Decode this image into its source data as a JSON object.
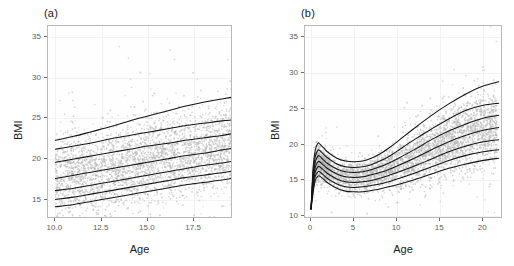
{
  "figure": {
    "panels": [
      {
        "tag": "(a)",
        "xlabel": "Age",
        "ylabel": "BMI",
        "x_ticks": [
          "10.0",
          "12.5",
          "15.0",
          "17.5"
        ],
        "y_ticks": [
          "15",
          "20",
          "25",
          "30",
          "35"
        ]
      },
      {
        "tag": "(b)",
        "xlabel": "Age",
        "ylabel": "BMI",
        "x_ticks": [
          "0",
          "5",
          "10",
          "15",
          "20"
        ],
        "y_ticks": [
          "10",
          "15",
          "20",
          "25",
          "30",
          "35"
        ]
      }
    ],
    "colors": {
      "point": "#b4b4b4",
      "curve": "#141414",
      "panel_border": "#b9b9b9",
      "grid_major": "#f2f2f2",
      "background": "#ffffff",
      "tick_text": "#5c5c5c",
      "axis_title": "#1a1a1a"
    }
  },
  "chart_data": [
    {
      "type": "line",
      "panel": "(a)",
      "title": "(a)",
      "xlabel": "Age",
      "ylabel": "BMI",
      "xlim": [
        9.6,
        19.6
      ],
      "ylim": [
        12.6,
        36.4
      ],
      "x_ticks": [
        10.0,
        12.5,
        15.0,
        17.5
      ],
      "y_ticks": [
        15,
        20,
        25,
        30,
        35
      ],
      "grid": true,
      "legend": "none",
      "description": "Adolescent BMI centile curves (age 10-19.5) over a scatter of individual observations; all seven centiles rise approximately linearly with age.",
      "x": [
        10.0,
        11.0,
        12.0,
        13.0,
        14.0,
        15.0,
        16.0,
        17.0,
        18.0,
        19.0,
        19.5
      ],
      "series": [
        {
          "name": "97th centile",
          "values": [
            22.3,
            22.8,
            23.4,
            24.0,
            24.7,
            25.3,
            25.9,
            26.5,
            27.0,
            27.4,
            27.6
          ]
        },
        {
          "name": "90th centile",
          "values": [
            21.2,
            21.6,
            22.0,
            22.5,
            22.9,
            23.3,
            23.7,
            24.1,
            24.4,
            24.7,
            24.8
          ]
        },
        {
          "name": "75th centile",
          "values": [
            19.6,
            20.0,
            20.4,
            20.8,
            21.2,
            21.6,
            21.9,
            22.3,
            22.6,
            22.9,
            23.1
          ]
        },
        {
          "name": "50th centile",
          "values": [
            17.6,
            18.0,
            18.4,
            18.8,
            19.2,
            19.6,
            20.0,
            20.4,
            20.7,
            21.1,
            21.3
          ]
        },
        {
          "name": "25th centile",
          "values": [
            16.1,
            16.4,
            16.8,
            17.2,
            17.6,
            18.0,
            18.4,
            18.8,
            19.2,
            19.5,
            19.7
          ]
        },
        {
          "name": "10th centile",
          "values": [
            15.0,
            15.3,
            15.7,
            16.1,
            16.5,
            16.9,
            17.3,
            17.7,
            18.0,
            18.3,
            18.5
          ]
        },
        {
          "name": "3rd centile",
          "values": [
            14.1,
            14.4,
            14.8,
            15.2,
            15.6,
            16.0,
            16.4,
            16.8,
            17.1,
            17.4,
            17.6
          ]
        }
      ]
    },
    {
      "type": "line",
      "panel": "(b)",
      "title": "(b)",
      "xlabel": "Age",
      "ylabel": "BMI",
      "xlim": [
        -0.7,
        22.3
      ],
      "ylim": [
        9.6,
        36.6
      ],
      "x_ticks": [
        0,
        5,
        10,
        15,
        20
      ],
      "y_ticks": [
        10,
        15,
        20,
        25,
        30,
        35
      ],
      "grid": true,
      "legend": "none",
      "description": "Full-range BMI centile curves from birth to age 22 over scattered observations; curves rise steeply to an infancy peak near age 0.8, decline to an adiposity rebound near age 6, then rise steadily through adolescence.",
      "x": [
        0.0,
        0.25,
        0.5,
        0.8,
        1.0,
        1.5,
        2.0,
        3.0,
        4.0,
        5.0,
        6.0,
        7.0,
        8.0,
        9.0,
        10.0,
        12.0,
        14.0,
        16.0,
        18.0,
        20.0,
        21.8
      ],
      "series": [
        {
          "name": "97th centile",
          "values": [
            11.0,
            16.9,
            19.3,
            20.2,
            20.1,
            19.5,
            18.9,
            18.1,
            17.7,
            17.6,
            17.7,
            18.1,
            18.7,
            19.5,
            20.4,
            22.3,
            24.1,
            25.7,
            27.1,
            28.2,
            28.8
          ]
        },
        {
          "name": "90th centile",
          "values": [
            11.0,
            16.2,
            18.4,
            19.2,
            19.2,
            18.6,
            18.1,
            17.3,
            16.9,
            16.8,
            16.9,
            17.2,
            17.7,
            18.3,
            19.1,
            20.7,
            22.2,
            23.6,
            24.8,
            25.5,
            25.8
          ]
        },
        {
          "name": "75th centile",
          "values": [
            11.0,
            15.6,
            17.6,
            18.4,
            18.4,
            17.8,
            17.3,
            16.6,
            16.2,
            16.1,
            16.2,
            16.5,
            16.9,
            17.4,
            18.0,
            19.3,
            20.7,
            21.9,
            22.9,
            23.7,
            24.1
          ]
        },
        {
          "name": "50th centile",
          "values": [
            11.0,
            15.0,
            16.9,
            17.6,
            17.6,
            17.1,
            16.6,
            15.9,
            15.5,
            15.4,
            15.5,
            15.8,
            16.1,
            16.5,
            17.0,
            18.1,
            19.3,
            20.4,
            21.3,
            22.0,
            22.4
          ]
        },
        {
          "name": "25th centile",
          "values": [
            11.0,
            14.4,
            16.2,
            16.9,
            16.9,
            16.4,
            15.9,
            15.2,
            14.8,
            14.7,
            14.8,
            15.0,
            15.3,
            15.7,
            16.1,
            17.0,
            18.0,
            19.0,
            19.8,
            20.4,
            20.7
          ]
        },
        {
          "name": "10th centile",
          "values": [
            11.0,
            13.9,
            15.6,
            16.2,
            16.2,
            15.7,
            15.2,
            14.5,
            14.1,
            14.0,
            14.1,
            14.3,
            14.5,
            14.8,
            15.2,
            16.0,
            16.9,
            17.8,
            18.5,
            19.0,
            19.3
          ]
        },
        {
          "name": "3rd centile",
          "values": [
            11.0,
            13.4,
            15.0,
            15.6,
            15.6,
            15.1,
            14.6,
            13.9,
            13.5,
            13.4,
            13.4,
            13.6,
            13.8,
            14.1,
            14.4,
            15.1,
            15.9,
            16.7,
            17.3,
            17.8,
            18.1
          ]
        }
      ]
    }
  ]
}
